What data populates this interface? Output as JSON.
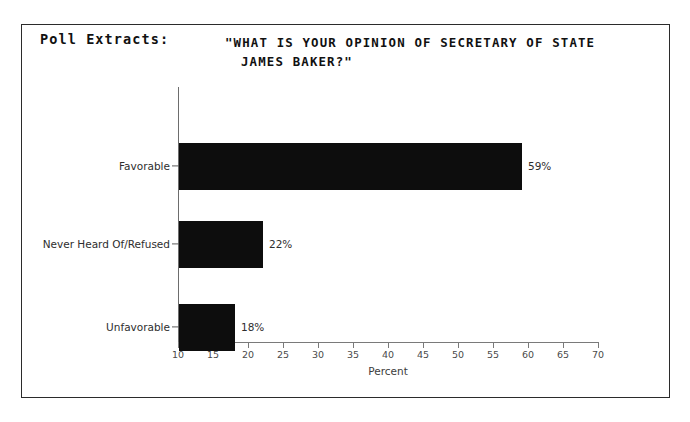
{
  "top_bleed_text": "_______  ______",
  "panel": {
    "heading": "Poll Extracts:"
  },
  "chart_data": {
    "type": "bar",
    "orientation": "horizontal",
    "title_line1": "\"WHAT IS YOUR OPINION OF SECRETARY OF STATE",
    "title_line2": "JAMES BAKER?\"",
    "title": "\"WHAT IS YOUR OPINION OF SECRETARY OF STATE JAMES BAKER?\"",
    "categories": [
      "Favorable",
      "Never Heard Of/Refused",
      "Unfavorable"
    ],
    "values": [
      59,
      22,
      18
    ],
    "value_labels": [
      "59%",
      "22%",
      "18%"
    ],
    "xlabel": "Percent",
    "ylabel": "",
    "xlim": [
      10,
      70
    ],
    "xticks": [
      10,
      15,
      20,
      25,
      30,
      35,
      40,
      45,
      50,
      55,
      60,
      65,
      70
    ],
    "xtick_labels": [
      "10",
      "15",
      "20",
      "25",
      "30",
      "35",
      "40",
      "45",
      "50",
      "55",
      "60",
      "65",
      "70"
    ],
    "grid": false,
    "legend": false,
    "bar_color": "#0d0d0d",
    "axis_color": "#7a7a7a"
  }
}
